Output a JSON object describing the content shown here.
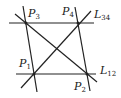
{
  "diagram": {
    "points": [
      {
        "id": "P1",
        "base": "P",
        "sub": "1",
        "x": 34,
        "y": 74
      },
      {
        "id": "P2",
        "base": "P",
        "sub": "2",
        "x": 87,
        "y": 74
      },
      {
        "id": "P3",
        "base": "P",
        "sub": "3",
        "x": 26,
        "y": 23
      },
      {
        "id": "P4",
        "base": "P",
        "sub": "4",
        "x": 78,
        "y": 23
      }
    ],
    "lines": [
      {
        "id": "L34",
        "base": "L",
        "sub": "34",
        "through": [
          "P3",
          "P4"
        ]
      },
      {
        "id": "L12",
        "base": "L",
        "sub": "12",
        "through": [
          "P1",
          "P2"
        ]
      },
      {
        "id": "P3P1",
        "through": [
          "P3",
          "P1"
        ]
      },
      {
        "id": "P4P2",
        "through": [
          "P4",
          "P2"
        ]
      },
      {
        "id": "P3P2",
        "through": [
          "P3",
          "P2"
        ]
      },
      {
        "id": "P1P4",
        "through": [
          "P1",
          "P4"
        ]
      }
    ],
    "labels": {
      "p1": {
        "base": "P",
        "sub": "1"
      },
      "p2": {
        "base": "P",
        "sub": "2"
      },
      "p3": {
        "base": "P",
        "sub": "3"
      },
      "p4": {
        "base": "P",
        "sub": "4"
      },
      "l34": {
        "base": "L",
        "sub": "34"
      },
      "l12": {
        "base": "L",
        "sub": "12"
      }
    }
  }
}
